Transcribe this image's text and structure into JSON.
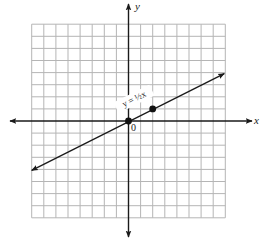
{
  "chart_data": {
    "type": "line",
    "title": "",
    "xlabel": "x",
    "ylabel": "y",
    "origin_label": "0",
    "xlim": [
      -8,
      8
    ],
    "ylim": [
      -8,
      8
    ],
    "grid": true,
    "grid_cells": 16,
    "series": [
      {
        "name": "y = ½x",
        "equation": "y = 1/2 x",
        "slope": 0.5,
        "intercept": 0,
        "x": [
          -8,
          8
        ],
        "y": [
          -4,
          4
        ],
        "arrows_both_ends": true
      }
    ],
    "points": [
      {
        "x": 0,
        "y": 0
      },
      {
        "x": 2,
        "y": 1
      }
    ],
    "annotations": [
      {
        "text": "y = ½x",
        "near": {
          "x": 0.5,
          "y": 2
        },
        "rotated_along_line": true
      }
    ]
  },
  "labels": {
    "x_axis": "x",
    "y_axis": "y",
    "origin": "0",
    "equation": "y = ½x"
  },
  "colors": {
    "grid": "#b5b5b5",
    "axis": "#1a1a1a",
    "line": "#1a1a1a",
    "point": "#111111",
    "background": "#ffffff"
  }
}
